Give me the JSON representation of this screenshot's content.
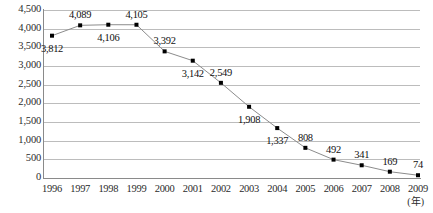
{
  "chart_data": {
    "type": "line",
    "title": "",
    "xlabel": "(年)",
    "ylabel": "",
    "categories": [
      "1996",
      "1997",
      "1998",
      "1999",
      "2000",
      "2001",
      "2002",
      "2003",
      "2004",
      "2005",
      "2006",
      "2007",
      "2008",
      "2009"
    ],
    "values": [
      3812,
      4089,
      4106,
      4105,
      3392,
      3142,
      2549,
      1908,
      1337,
      808,
      492,
      341,
      169,
      74
    ],
    "point_labels": [
      "3,812",
      "4,089",
      "4,106",
      "4,105",
      "3,392",
      "3,142",
      "2,549",
      "1,908",
      "1,337",
      "808",
      "492",
      "341",
      "169",
      "74"
    ],
    "label_placement": [
      "below",
      "above",
      "below",
      "above",
      "above",
      "below",
      "above",
      "below",
      "below",
      "above",
      "above",
      "above",
      "above",
      "above"
    ],
    "ylim": [
      0,
      4500
    ],
    "ytick_values": [
      0,
      500,
      1000,
      1500,
      2000,
      2500,
      3000,
      3500,
      4000,
      4500
    ],
    "ytick_labels": [
      "0",
      "500",
      "1,000",
      "1,500",
      "2,000",
      "2,500",
      "3,000",
      "3,500",
      "4,000",
      "4,500"
    ],
    "grid": true,
    "legend": "none",
    "series": [
      {
        "name": "series-1",
        "values": [
          3812,
          4089,
          4106,
          4105,
          3392,
          3142,
          2549,
          1908,
          1337,
          808,
          492,
          341,
          169,
          74
        ],
        "line_color": "#8c8c8c",
        "marker_color": "#000000",
        "marker": "square"
      }
    ]
  },
  "colors": {
    "grid": "#bcbcbc",
    "axis": "#8a8a8a",
    "line": "#8c8c8c",
    "marker": "#000000",
    "text": "#1a1a1a",
    "background": "#ffffff"
  }
}
